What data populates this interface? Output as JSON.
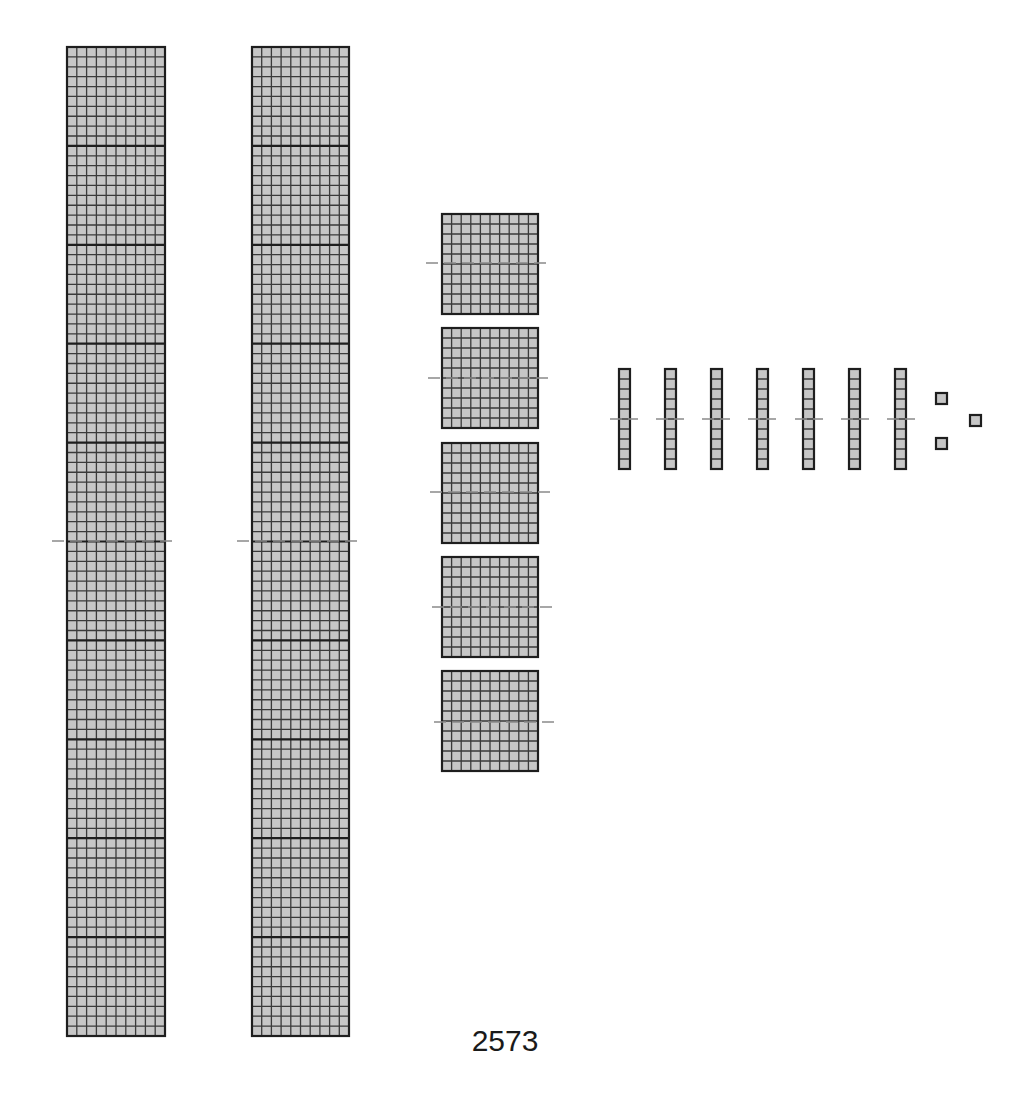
{
  "diagram": {
    "number_label": "2573",
    "value": 2573,
    "place_values": {
      "thousands": 2,
      "hundreds": 5,
      "tens": 7,
      "ones": 3
    },
    "colors": {
      "block_fill": "#c6c6c6",
      "grid_line": "#3a3a3a",
      "outline": "#1e1e1e",
      "divider": "#1e1e1e",
      "dash_line": "#8a8a8a",
      "background": "#ffffff"
    },
    "thousands": [
      {
        "x": 67,
        "y": 47,
        "w": 98,
        "h": 989,
        "dash": {
          "x1": 52,
          "x2": 177,
          "y": 541
        }
      },
      {
        "x": 252,
        "y": 47,
        "w": 97,
        "h": 989,
        "dash": {
          "x1": 237,
          "x2": 362,
          "y": 541
        }
      }
    ],
    "hundreds": [
      {
        "x": 442,
        "y": 214,
        "w": 96,
        "h": 100,
        "dash": {
          "x1": 426,
          "x2": 550,
          "y": 263
        }
      },
      {
        "x": 442,
        "y": 328,
        "w": 96,
        "h": 100,
        "dash": {
          "x1": 428,
          "x2": 552,
          "y": 378
        }
      },
      {
        "x": 442,
        "y": 443,
        "w": 96,
        "h": 100,
        "dash": {
          "x1": 430,
          "x2": 554,
          "y": 492
        }
      },
      {
        "x": 442,
        "y": 557,
        "w": 96,
        "h": 100,
        "dash": {
          "x1": 432,
          "x2": 556,
          "y": 607
        }
      },
      {
        "x": 442,
        "y": 671,
        "w": 96,
        "h": 100,
        "dash": {
          "x1": 434,
          "x2": 558,
          "y": 722
        }
      }
    ],
    "tens": [
      {
        "x": 619,
        "y": 369,
        "w": 11,
        "h": 100,
        "dash": {
          "x1": 610,
          "x2": 638,
          "y": 419
        }
      },
      {
        "x": 665,
        "y": 369,
        "w": 11,
        "h": 100,
        "dash": {
          "x1": 656,
          "x2": 684,
          "y": 419
        }
      },
      {
        "x": 711,
        "y": 369,
        "w": 11,
        "h": 100,
        "dash": {
          "x1": 702,
          "x2": 730,
          "y": 419
        }
      },
      {
        "x": 757,
        "y": 369,
        "w": 11,
        "h": 100,
        "dash": {
          "x1": 748,
          "x2": 776,
          "y": 419
        }
      },
      {
        "x": 803,
        "y": 369,
        "w": 11,
        "h": 100,
        "dash": {
          "x1": 795,
          "x2": 823,
          "y": 419
        }
      },
      {
        "x": 849,
        "y": 369,
        "w": 11,
        "h": 100,
        "dash": {
          "x1": 841,
          "x2": 869,
          "y": 419
        }
      },
      {
        "x": 895,
        "y": 369,
        "w": 11,
        "h": 100,
        "dash": {
          "x1": 887,
          "x2": 915,
          "y": 419
        }
      }
    ],
    "ones": [
      {
        "x": 936,
        "y": 393,
        "w": 11,
        "h": 11
      },
      {
        "x": 970,
        "y": 415,
        "w": 11,
        "h": 11
      },
      {
        "x": 936,
        "y": 438,
        "w": 11,
        "h": 11
      }
    ]
  }
}
